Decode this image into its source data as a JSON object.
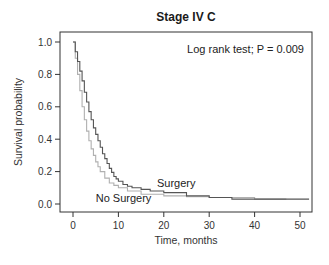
{
  "chart_data": {
    "type": "line",
    "step": true,
    "title": "Stage IV C",
    "xlabel": "Time, months",
    "ylabel": "Survival probability",
    "xlim": [
      -2,
      52
    ],
    "ylim": [
      -0.06,
      1.06
    ],
    "xticks": [
      0,
      10,
      20,
      30,
      40,
      50
    ],
    "yticks": [
      0.0,
      0.2,
      0.4,
      0.6,
      0.8,
      1.0
    ],
    "xtick_labels": [
      "0",
      "10",
      "20",
      "30",
      "40",
      "50"
    ],
    "ytick_labels": [
      "0.0",
      "0.2",
      "0.4",
      "0.6",
      "0.8",
      "1.0"
    ],
    "grid": false,
    "annotation": "Log rank test; P = 0.009",
    "series": [
      {
        "name": "Surgery",
        "color": "#555555",
        "label_at": [
          18.5,
          0.105
        ],
        "x": [
          0,
          0.5,
          1,
          1.5,
          2,
          2.5,
          3,
          3.5,
          4,
          4.5,
          5,
          5.5,
          6,
          6.5,
          7,
          7.5,
          8,
          8.5,
          9,
          9.5,
          10,
          11,
          12,
          13,
          15,
          17,
          20,
          25,
          30,
          35,
          52
        ],
        "y": [
          1.0,
          0.94,
          0.88,
          0.82,
          0.76,
          0.69,
          0.63,
          0.57,
          0.52,
          0.47,
          0.43,
          0.39,
          0.35,
          0.31,
          0.28,
          0.25,
          0.22,
          0.195,
          0.17,
          0.155,
          0.14,
          0.12,
          0.11,
          0.1,
          0.09,
          0.08,
          0.07,
          0.05,
          0.04,
          0.03,
          0.03
        ]
      },
      {
        "name": "No Surgery",
        "color": "#b0b0b0",
        "label_at": [
          5,
          0.015
        ],
        "x": [
          0,
          0.5,
          1,
          1.5,
          2,
          2.5,
          3,
          3.5,
          4,
          4.5,
          5,
          5.5,
          6,
          7,
          8,
          9,
          10,
          12,
          15,
          20,
          25,
          30,
          40,
          47
        ],
        "y": [
          1.0,
          0.9,
          0.8,
          0.7,
          0.6,
          0.52,
          0.45,
          0.39,
          0.34,
          0.3,
          0.26,
          0.23,
          0.2,
          0.16,
          0.13,
          0.115,
          0.1,
          0.08,
          0.06,
          0.05,
          0.045,
          0.04,
          0.03,
          0.03
        ]
      }
    ]
  }
}
